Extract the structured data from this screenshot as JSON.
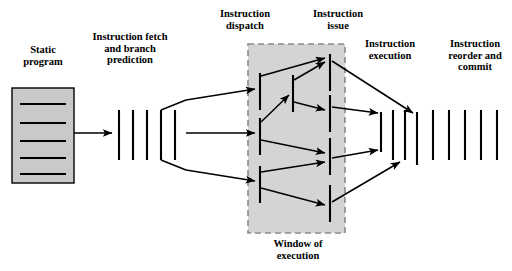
{
  "diagram": {
    "colors": {
      "background": "#ffffff",
      "line": "#000000",
      "box_fill": "#c9c9c9",
      "window_fill": "#d4d4d4",
      "window_border": "#8a8a8a"
    },
    "labels": {
      "static_program": "Static\nprogram",
      "instruction_fetch": "Instruction fetch\nand  branch\nprediction",
      "instruction_dispatch": "Instruction\ndispatch",
      "instruction_issue": "Instruction\nissue",
      "instruction_execution": "Instruction\nexecution",
      "instruction_reorder": "Instruction\nreorder and\ncommit",
      "window_of_execution": "Window of\nexecution"
    },
    "static_program_box": {
      "x": 12,
      "y": 88,
      "width": 62,
      "height": 95,
      "instruction_line_count": 5,
      "instruction_line_y": [
        104,
        123,
        141,
        158,
        174
      ]
    },
    "fetch_bars": {
      "count": 5,
      "x": [
        119,
        133,
        147,
        161,
        175
      ],
      "y_top": 110,
      "y_bottom": 160
    },
    "window_box": {
      "x": 248,
      "y": 44,
      "width": 97,
      "height": 189
    },
    "window_left_bars": {
      "count": 3,
      "x": 260,
      "segments": [
        {
          "y_top": 73,
          "y_bottom": 110
        },
        {
          "y_top": 118,
          "y_bottom": 155
        },
        {
          "y_top": 166,
          "y_bottom": 203
        }
      ]
    },
    "window_mid_bars": {
      "count": 1,
      "x": 293,
      "segments": [
        {
          "y_top": 75,
          "y_bottom": 112
        }
      ]
    },
    "window_right_bars": {
      "count": 4,
      "x": 330,
      "segments": [
        {
          "y_top": 54,
          "y_bottom": 91
        },
        {
          "y_top": 95,
          "y_bottom": 132
        },
        {
          "y_top": 138,
          "y_bottom": 175
        },
        {
          "y_top": 185,
          "y_bottom": 222
        }
      ]
    },
    "execution_bars": {
      "count": 4,
      "x": [
        381,
        393,
        405,
        417
      ],
      "y_top": 110,
      "y_bottom": 165
    },
    "reorder_bars": {
      "count": 5,
      "x": [
        433,
        449,
        465,
        481,
        497
      ],
      "y_top": 110,
      "y_bottom": 160
    }
  }
}
